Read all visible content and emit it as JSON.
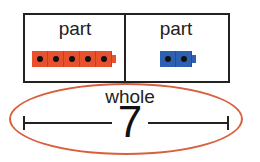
{
  "diagram": {
    "type": "part-part-whole",
    "parts": [
      {
        "label": "part",
        "cube_count": 5,
        "cube_color": "#e8512e"
      },
      {
        "label": "part",
        "cube_count": 2,
        "cube_color": "#2e5fb0"
      }
    ],
    "whole": {
      "label": "whole",
      "value": "7"
    },
    "colors": {
      "ellipse": "#d9603f",
      "lines": "#222222"
    }
  }
}
